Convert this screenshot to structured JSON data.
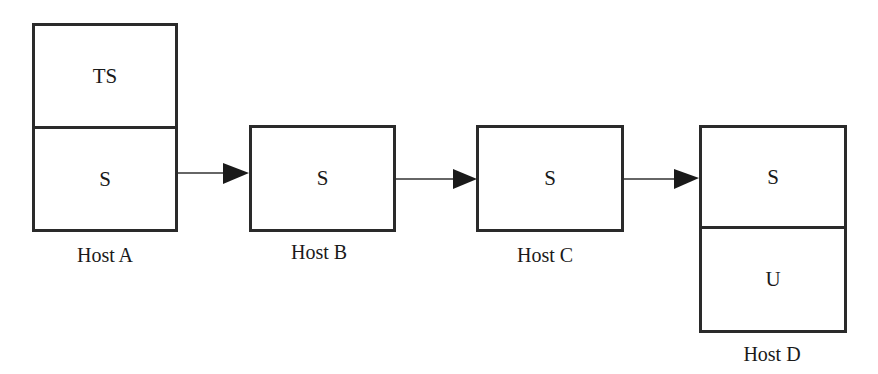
{
  "diagram": {
    "type": "host-chain",
    "hosts": [
      {
        "label": "Host A",
        "cells": [
          "TS",
          "S"
        ]
      },
      {
        "label": "Host B",
        "cells": [
          "S"
        ]
      },
      {
        "label": "Host C",
        "cells": [
          "S"
        ]
      },
      {
        "label": "Host D",
        "cells": [
          "S",
          "U"
        ]
      }
    ],
    "edges": [
      {
        "from": "Host A",
        "to": "Host B"
      },
      {
        "from": "Host B",
        "to": "Host C"
      },
      {
        "from": "Host C",
        "to": "Host D"
      }
    ]
  }
}
